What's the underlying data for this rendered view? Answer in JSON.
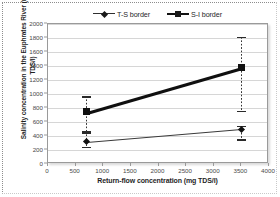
{
  "chart_data": {
    "type": "line",
    "title": "",
    "xlabel": "Return-flow concentration (mg TDS/l)",
    "ylabel": "Salinity concentration in the Euphrates River (mg TDS/l)",
    "xlim": [
      0,
      4000
    ],
    "ylim": [
      0,
      2000
    ],
    "xticks": [
      0,
      500,
      1000,
      1500,
      2000,
      2500,
      3000,
      3500,
      4000
    ],
    "yticks": [
      0,
      200,
      400,
      600,
      800,
      1000,
      1200,
      1400,
      1600,
      1800,
      2000
    ],
    "grid": "horizontal",
    "legend_position": "top-center",
    "x": [
      700,
      3500
    ],
    "series": [
      {
        "name": "T-S border",
        "marker": "diamond",
        "color": "#3a3a3a",
        "values": [
          315,
          500
        ],
        "error_low": [
          250,
          355
        ],
        "error_high": [
          470,
          545
        ]
      },
      {
        "name": "S-I border",
        "marker": "square",
        "color": "#101010",
        "values": [
          745,
          1385
        ],
        "error_low": [
          455,
          760
        ],
        "error_high": [
          965,
          1820
        ]
      }
    ]
  },
  "legend": {
    "entries": [
      {
        "label": "T-S border",
        "marker": "diamond"
      },
      {
        "label": "S-I border",
        "marker": "square"
      }
    ]
  },
  "axes": {
    "x_title": "Return-flow concentration (mg TDS/l)",
    "y_title": "Salinity concentration in the Euphrates River (mg TDS/l)"
  },
  "colors": {
    "series_1": "#3a3a3a",
    "series_2": "#101010",
    "gridline": "#d6d6d6",
    "frame": "#9a9a9a",
    "page_border": "#8d8d8d"
  }
}
